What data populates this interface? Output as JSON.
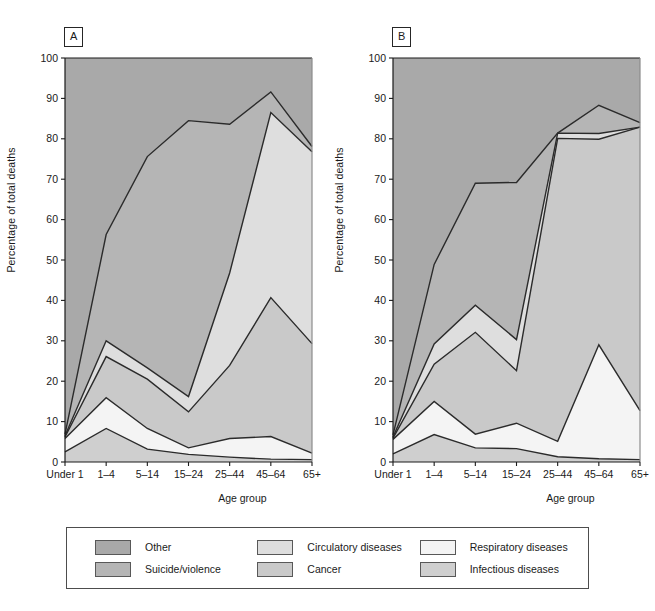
{
  "figure": {
    "panels": [
      {
        "id": "A",
        "label": "A"
      },
      {
        "id": "B",
        "label": "B"
      }
    ],
    "ylabel": "Percentage of total deaths",
    "xlabel": "Age group"
  },
  "legend": {
    "items": [
      {
        "name": "Other",
        "color": "#a9a9a9"
      },
      {
        "name": "Suicide/violence",
        "color": "#b5b5b5"
      },
      {
        "name": "Circulatory diseases",
        "color": "#dedede"
      },
      {
        "name": "Cancer",
        "color": "#c9c9c9"
      },
      {
        "name": "Respiratory diseases",
        "color": "#f4f4f4"
      },
      {
        "name": "Infectious diseases",
        "color": "#cfcfcf"
      }
    ]
  },
  "chart_data": [
    {
      "type": "area",
      "title": "A",
      "stacked": true,
      "xlabel": "Age group",
      "ylabel": "Percentage of total deaths",
      "ylim": [
        0,
        100
      ],
      "yticks": [
        0,
        10,
        20,
        30,
        40,
        50,
        60,
        70,
        80,
        90,
        100
      ],
      "grid": false,
      "legend_position": "bottom",
      "categories": [
        "Under 1",
        "1–4",
        "5–14",
        "15–24",
        "25–44",
        "45–64",
        "65+"
      ],
      "series": [
        {
          "name": "Infectious diseases",
          "values": [
            2.5,
            8.3,
            3.2,
            1.9,
            1.2,
            0.7,
            0.6
          ]
        },
        {
          "name": "Respiratory diseases",
          "values": [
            3.3,
            7.6,
            5.1,
            1.6,
            4.6,
            5.6,
            1.6
          ]
        },
        {
          "name": "Cancer",
          "values": [
            0.4,
            10.2,
            12.2,
            8.9,
            18.1,
            34.4,
            27.1
          ]
        },
        {
          "name": "Circulatory diseases",
          "values": [
            0.3,
            3.9,
            2.8,
            3.8,
            22.9,
            45.8,
            47.5
          ]
        },
        {
          "name": "Suicide/violence",
          "values": [
            0.4,
            26.3,
            52.3,
            68.3,
            36.8,
            5.1,
            1.3
          ]
        },
        {
          "name": "Other",
          "values": [
            93.1,
            43.7,
            24.4,
            15.5,
            16.4,
            8.4,
            21.9
          ]
        }
      ],
      "cumulative_boundaries": {
        "infectious": [
          2.5,
          8.3,
          3.2,
          1.9,
          1.2,
          0.7,
          0.6
        ],
        "respiratory": [
          5.8,
          15.9,
          8.3,
          3.5,
          5.8,
          6.3,
          2.2
        ],
        "cancer": [
          6.2,
          26.1,
          20.5,
          12.4,
          23.9,
          40.7,
          29.3
        ],
        "circulatory": [
          6.5,
          30.0,
          23.3,
          16.2,
          46.8,
          86.5,
          76.8
        ],
        "suicide": [
          6.9,
          56.3,
          75.6,
          84.5,
          83.6,
          91.6,
          78.1
        ]
      }
    },
    {
      "type": "area",
      "title": "B",
      "stacked": true,
      "xlabel": "Age group",
      "ylabel": "Percentage of total deaths",
      "ylim": [
        0,
        100
      ],
      "yticks": [
        0,
        10,
        20,
        30,
        40,
        50,
        60,
        70,
        80,
        90,
        100
      ],
      "grid": false,
      "legend_position": "bottom",
      "categories": [
        "Under 1",
        "1–4",
        "5–14",
        "15–24",
        "25–44",
        "45–64",
        "65+"
      ],
      "series": [
        {
          "name": "Infectious diseases",
          "values": [
            2.0,
            6.8,
            3.5,
            3.3,
            1.3,
            0.8,
            0.6
          ]
        },
        {
          "name": "Respiratory diseases",
          "values": [
            3.6,
            8.2,
            3.4,
            6.3,
            3.8,
            28.2,
            12.1
          ]
        },
        {
          "name": "Cancer",
          "values": [
            0.3,
            9.2,
            25.2,
            13.0,
            75.0,
            50.9,
            70.2
          ]
        },
        {
          "name": "Circulatory diseases",
          "values": [
            0.3,
            5.0,
            6.7,
            7.7,
            1.3,
            1.4,
            0.0
          ]
        },
        {
          "name": "Suicide/violence",
          "values": [
            0.5,
            19.7,
            30.2,
            38.9,
            0.0,
            7.0,
            1.1
          ]
        },
        {
          "name": "Other",
          "values": [
            93.3,
            51.1,
            31.0,
            30.8,
            18.6,
            11.7,
            16.0
          ]
        }
      ],
      "cumulative_boundaries": {
        "infectious": [
          2.0,
          6.8,
          3.5,
          3.3,
          1.3,
          0.8,
          0.6
        ],
        "respiratory": [
          5.6,
          15.0,
          6.9,
          9.6,
          5.1,
          29.0,
          12.7
        ],
        "cancer": [
          5.9,
          24.2,
          32.1,
          22.6,
          80.1,
          79.9,
          82.9
        ],
        "circulatory": [
          6.2,
          29.2,
          38.8,
          30.3,
          81.4,
          81.3,
          82.9
        ],
        "suicide": [
          6.7,
          48.9,
          69.0,
          69.2,
          81.4,
          88.3,
          84.0
        ]
      }
    }
  ]
}
